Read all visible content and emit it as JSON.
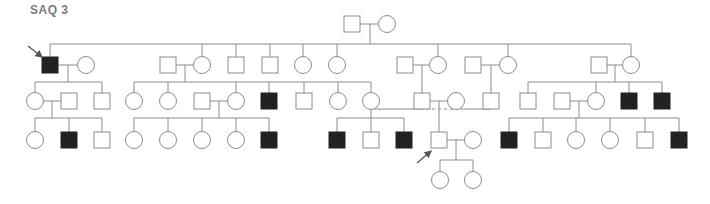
{
  "title": "SAQ 3",
  "style": {
    "line": "#8c8c8c",
    "affected_fill": "#222222",
    "unaffected_fill": "#ffffff",
    "arrow": "#555555"
  },
  "generations": {
    "I": {
      "y": 24
    },
    "II": {
      "y": 65,
      "sibship_y": 44
    },
    "III": {
      "y": 101,
      "sibship_y": 82
    },
    "IV": {
      "y": 140,
      "sibship_y": 118
    },
    "V": {
      "y": 180,
      "sibship_y": 160
    }
  },
  "individuals": [
    {
      "id": "I-1",
      "sex": "M",
      "x": 352,
      "y": 24,
      "affected": false
    },
    {
      "id": "I-2",
      "sex": "F",
      "x": 387,
      "y": 24,
      "affected": false
    },
    {
      "id": "II-1",
      "sex": "M",
      "x": 50,
      "y": 65,
      "affected": true,
      "proband": true
    },
    {
      "id": "II-2",
      "sex": "F",
      "x": 86,
      "y": 65,
      "affected": false
    },
    {
      "id": "II-3",
      "sex": "M",
      "x": 168,
      "y": 65,
      "affected": false
    },
    {
      "id": "II-4",
      "sex": "F",
      "x": 202,
      "y": 65,
      "affected": false
    },
    {
      "id": "II-5",
      "sex": "M",
      "x": 236,
      "y": 65,
      "affected": false
    },
    {
      "id": "II-6",
      "sex": "M",
      "x": 270,
      "y": 65,
      "affected": false
    },
    {
      "id": "II-7",
      "sex": "F",
      "x": 303,
      "y": 65,
      "affected": false
    },
    {
      "id": "II-8",
      "sex": "F",
      "x": 337,
      "y": 65,
      "affected": false
    },
    {
      "id": "II-9",
      "sex": "M",
      "x": 405,
      "y": 65,
      "affected": false
    },
    {
      "id": "II-10",
      "sex": "F",
      "x": 438,
      "y": 65,
      "affected": false
    },
    {
      "id": "II-11",
      "sex": "M",
      "x": 473,
      "y": 65,
      "affected": false
    },
    {
      "id": "II-12",
      "sex": "F",
      "x": 508,
      "y": 65,
      "affected": false
    },
    {
      "id": "II-13",
      "sex": "M",
      "x": 599,
      "y": 65,
      "affected": false
    },
    {
      "id": "II-14",
      "sex": "F",
      "x": 631,
      "y": 65,
      "affected": false
    },
    {
      "id": "III-1",
      "sex": "F",
      "x": 35,
      "y": 101,
      "affected": false
    },
    {
      "id": "III-2",
      "sex": "M",
      "x": 69,
      "y": 101,
      "affected": false
    },
    {
      "id": "III-3",
      "sex": "M",
      "x": 102,
      "y": 101,
      "affected": false
    },
    {
      "id": "III-4",
      "sex": "F",
      "x": 134,
      "y": 101,
      "affected": false
    },
    {
      "id": "III-5",
      "sex": "F",
      "x": 168,
      "y": 101,
      "affected": false
    },
    {
      "id": "III-6",
      "sex": "M",
      "x": 202,
      "y": 101,
      "affected": false
    },
    {
      "id": "III-7",
      "sex": "F",
      "x": 236,
      "y": 101,
      "affected": false
    },
    {
      "id": "III-8",
      "sex": "M",
      "x": 269,
      "y": 101,
      "affected": true
    },
    {
      "id": "III-9",
      "sex": "M",
      "x": 304,
      "y": 101,
      "affected": false
    },
    {
      "id": "III-10",
      "sex": "F",
      "x": 338,
      "y": 101,
      "affected": false
    },
    {
      "id": "III-11",
      "sex": "F",
      "x": 371,
      "y": 101,
      "affected": false
    },
    {
      "id": "III-12",
      "sex": "M",
      "x": 422,
      "y": 101,
      "affected": false
    },
    {
      "id": "III-13",
      "sex": "F",
      "x": 456,
      "y": 101,
      "affected": false
    },
    {
      "id": "III-14",
      "sex": "M",
      "x": 491,
      "y": 101,
      "affected": false
    },
    {
      "id": "III-15",
      "sex": "M",
      "x": 528,
      "y": 101,
      "affected": false
    },
    {
      "id": "III-16",
      "sex": "M",
      "x": 562,
      "y": 101,
      "affected": false
    },
    {
      "id": "III-17",
      "sex": "F",
      "x": 596,
      "y": 101,
      "affected": false
    },
    {
      "id": "III-18",
      "sex": "M",
      "x": 629,
      "y": 101,
      "affected": true
    },
    {
      "id": "III-19",
      "sex": "M",
      "x": 662,
      "y": 101,
      "affected": true
    },
    {
      "id": "IV-1",
      "sex": "F",
      "x": 35,
      "y": 140,
      "affected": false
    },
    {
      "id": "IV-2",
      "sex": "M",
      "x": 69,
      "y": 140,
      "affected": true
    },
    {
      "id": "IV-3",
      "sex": "M",
      "x": 102,
      "y": 140,
      "affected": false
    },
    {
      "id": "IV-4",
      "sex": "F",
      "x": 134,
      "y": 140,
      "affected": false
    },
    {
      "id": "IV-5",
      "sex": "F",
      "x": 168,
      "y": 140,
      "affected": false
    },
    {
      "id": "IV-6",
      "sex": "F",
      "x": 202,
      "y": 140,
      "affected": false
    },
    {
      "id": "IV-7",
      "sex": "F",
      "x": 236,
      "y": 140,
      "affected": false
    },
    {
      "id": "IV-8",
      "sex": "M",
      "x": 269,
      "y": 140,
      "affected": true
    },
    {
      "id": "IV-9",
      "sex": "M",
      "x": 337,
      "y": 140,
      "affected": true
    },
    {
      "id": "IV-10",
      "sex": "M",
      "x": 371,
      "y": 140,
      "affected": false
    },
    {
      "id": "IV-11",
      "sex": "M",
      "x": 404,
      "y": 140,
      "affected": true
    },
    {
      "id": "IV-12",
      "sex": "M",
      "x": 439,
      "y": 140,
      "affected": false,
      "proband": true
    },
    {
      "id": "IV-13",
      "sex": "F",
      "x": 473,
      "y": 140,
      "affected": false
    },
    {
      "id": "IV-14",
      "sex": "M",
      "x": 509,
      "y": 140,
      "affected": true
    },
    {
      "id": "IV-15",
      "sex": "M",
      "x": 543,
      "y": 140,
      "affected": false
    },
    {
      "id": "IV-16",
      "sex": "F",
      "x": 576,
      "y": 140,
      "affected": false
    },
    {
      "id": "IV-17",
      "sex": "F",
      "x": 610,
      "y": 140,
      "affected": false
    },
    {
      "id": "IV-18",
      "sex": "M",
      "x": 645,
      "y": 140,
      "affected": false
    },
    {
      "id": "IV-19",
      "sex": "M",
      "x": 679,
      "y": 140,
      "affected": true
    },
    {
      "id": "V-1",
      "sex": "F",
      "x": 440,
      "y": 180,
      "affected": false
    },
    {
      "id": "V-2",
      "sex": "F",
      "x": 473,
      "y": 180,
      "affected": false
    }
  ],
  "lines": [
    [
      360,
      24,
      379,
      24
    ],
    [
      370,
      24,
      370,
      44
    ],
    [
      50,
      44,
      631,
      44
    ],
    [
      50,
      44,
      50,
      57
    ],
    [
      202,
      44,
      202,
      57
    ],
    [
      236,
      44,
      236,
      57
    ],
    [
      270,
      44,
      270,
      57
    ],
    [
      303,
      44,
      303,
      57
    ],
    [
      337,
      44,
      337,
      57
    ],
    [
      438,
      44,
      438,
      57
    ],
    [
      508,
      44,
      508,
      57
    ],
    [
      631,
      44,
      631,
      57
    ],
    [
      58,
      65,
      78,
      65
    ],
    [
      68,
      65,
      68,
      82
    ],
    [
      35,
      82,
      102,
      82
    ],
    [
      35,
      82,
      35,
      93
    ],
    [
      102,
      82,
      102,
      93
    ],
    [
      176,
      65,
      194,
      65
    ],
    [
      185,
      65,
      185,
      82
    ],
    [
      134,
      82,
      371,
      82
    ],
    [
      134,
      82,
      134,
      93
    ],
    [
      168,
      82,
      168,
      93
    ],
    [
      236,
      82,
      236,
      93
    ],
    [
      269,
      82,
      269,
      93
    ],
    [
      304,
      82,
      304,
      93
    ],
    [
      338,
      82,
      338,
      93
    ],
    [
      371,
      82,
      371,
      93
    ],
    [
      413,
      65,
      430,
      65
    ],
    [
      422,
      65,
      422,
      93
    ],
    [
      481,
      65,
      500,
      65
    ],
    [
      491,
      65,
      491,
      93
    ],
    [
      607,
      65,
      623,
      65
    ],
    [
      615,
      65,
      615,
      82
    ],
    [
      528,
      82,
      662,
      82
    ],
    [
      528,
      82,
      528,
      93
    ],
    [
      596,
      82,
      596,
      93
    ],
    [
      629,
      82,
      629,
      93
    ],
    [
      662,
      82,
      662,
      93
    ],
    [
      43,
      101,
      61,
      101
    ],
    [
      52,
      101,
      52,
      118
    ],
    [
      35,
      118,
      102,
      118
    ],
    [
      35,
      118,
      35,
      132
    ],
    [
      69,
      118,
      69,
      132
    ],
    [
      102,
      118,
      102,
      132
    ],
    [
      210,
      101,
      228,
      101
    ],
    [
      219,
      101,
      219,
      118
    ],
    [
      134,
      118,
      269,
      118
    ],
    [
      134,
      118,
      134,
      132
    ],
    [
      168,
      118,
      168,
      132
    ],
    [
      202,
      118,
      202,
      132
    ],
    [
      236,
      118,
      236,
      132
    ],
    [
      269,
      118,
      269,
      132
    ],
    [
      430,
      101,
      448,
      101
    ],
    [
      439,
      101,
      439,
      132
    ],
    [
      570,
      101,
      588,
      101
    ],
    [
      579,
      101,
      579,
      118
    ],
    [
      509,
      118,
      679,
      118
    ],
    [
      509,
      118,
      509,
      132
    ],
    [
      543,
      118,
      543,
      132
    ],
    [
      576,
      118,
      576,
      132
    ],
    [
      610,
      118,
      610,
      132
    ],
    [
      645,
      118,
      645,
      132
    ],
    [
      679,
      118,
      679,
      132
    ],
    [
      447,
      140,
      465,
      140
    ],
    [
      456,
      140,
      456,
      160
    ],
    [
      440,
      160,
      473,
      160
    ],
    [
      440,
      160,
      440,
      172
    ],
    [
      473,
      160,
      473,
      172
    ]
  ],
  "consanguinity_lines": [
    [
      371,
      109,
      420,
      109
    ],
    [
      460,
      109,
      491,
      109
    ],
    [
      491,
      101,
      491,
      109
    ]
  ],
  "dashed_lines": [
    [
      420,
      109,
      460,
      109
    ]
  ],
  "cross_marriage_sibship": [
    [
      371,
      109,
      371,
      118
    ],
    [
      337,
      118,
      404,
      118
    ],
    [
      337,
      118,
      337,
      132
    ],
    [
      371,
      118,
      371,
      132
    ],
    [
      404,
      118,
      404,
      132
    ]
  ],
  "arrows": [
    {
      "from": [
        28,
        46
      ],
      "to": [
        42,
        57
      ]
    },
    {
      "from": [
        417,
        163
      ],
      "to": [
        431,
        151
      ]
    }
  ]
}
